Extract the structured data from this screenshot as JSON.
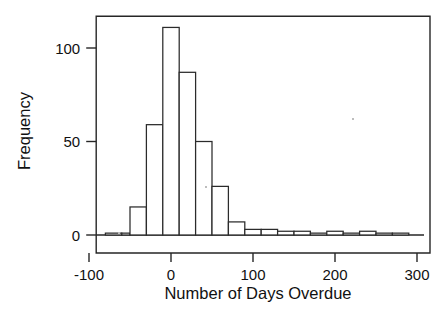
{
  "figure": {
    "background": "#ffffff",
    "ink_color": "#262626"
  },
  "chart_data": {
    "type": "bar",
    "title": "",
    "subtitle": "",
    "xlabel": "Number of Days Overdue",
    "ylabel": "Frequency",
    "xlim": [
      -90,
      300
    ],
    "ylim": [
      0,
      117
    ],
    "grid": false,
    "legend": false,
    "legend_position": "none",
    "bin_width": 20,
    "xticks": [
      -100,
      0,
      100,
      200,
      300
    ],
    "xticklabels": [
      "-100",
      "0",
      "100",
      "200",
      "300"
    ],
    "yticks": [
      0,
      50,
      100
    ],
    "yticklabels": [
      "0",
      "50",
      "100"
    ],
    "bins": [
      {
        "left": -80,
        "right": -60,
        "value": 1
      },
      {
        "left": -60,
        "right": -50,
        "value": 1
      },
      {
        "left": -50,
        "right": -30,
        "value": 15
      },
      {
        "left": -30,
        "right": -10,
        "value": 59
      },
      {
        "left": -10,
        "right": 10,
        "value": 111
      },
      {
        "left": 10,
        "right": 30,
        "value": 87
      },
      {
        "left": 30,
        "right": 50,
        "value": 50
      },
      {
        "left": 50,
        "right": 70,
        "value": 26
      },
      {
        "left": 70,
        "right": 90,
        "value": 7
      },
      {
        "left": 90,
        "right": 110,
        "value": 3
      },
      {
        "left": 110,
        "right": 130,
        "value": 3
      },
      {
        "left": 130,
        "right": 150,
        "value": 2
      },
      {
        "left": 150,
        "right": 170,
        "value": 2
      },
      {
        "left": 170,
        "right": 190,
        "value": 1
      },
      {
        "left": 190,
        "right": 210,
        "value": 2
      },
      {
        "left": 210,
        "right": 230,
        "value": 1
      },
      {
        "left": 230,
        "right": 250,
        "value": 2
      },
      {
        "left": 250,
        "right": 270,
        "value": 1
      },
      {
        "left": 270,
        "right": 290,
        "value": 1
      }
    ],
    "categories": [
      "-80",
      "-60",
      "-50",
      "-30",
      "-10",
      "10",
      "30",
      "50",
      "70",
      "90",
      "110",
      "130",
      "150",
      "170",
      "190",
      "210",
      "230",
      "250",
      "270"
    ],
    "values": [
      1,
      1,
      15,
      59,
      111,
      87,
      50,
      26,
      7,
      3,
      3,
      2,
      2,
      1,
      2,
      1,
      2,
      1,
      1
    ]
  }
}
